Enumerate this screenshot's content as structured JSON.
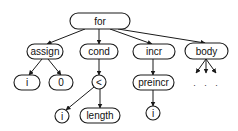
{
  "diagram": {
    "type": "abstract-syntax-tree",
    "root": "for",
    "nodes": [
      {
        "id": "for",
        "label": "for",
        "shape": "rounded-rect",
        "x": 70,
        "y": 13,
        "w": 60,
        "h": 16
      },
      {
        "id": "assign",
        "label": "assign",
        "shape": "rounded-rect",
        "x": 27,
        "y": 44,
        "w": 36,
        "h": 15
      },
      {
        "id": "cond",
        "label": "cond",
        "shape": "rounded-rect",
        "x": 80,
        "y": 44,
        "w": 38,
        "h": 15
      },
      {
        "id": "incr",
        "label": "incr",
        "shape": "rounded-rect",
        "x": 133,
        "y": 44,
        "w": 42,
        "h": 15
      },
      {
        "id": "body",
        "label": "body",
        "shape": "rounded-rect",
        "x": 185,
        "y": 43,
        "w": 43,
        "h": 16
      },
      {
        "id": "assign_i",
        "label": "i",
        "shape": "rounded-rect",
        "x": 14,
        "y": 75,
        "w": 26,
        "h": 15
      },
      {
        "id": "assign_0",
        "label": "0",
        "shape": "rounded-rect",
        "x": 49,
        "y": 75,
        "w": 24,
        "h": 15
      },
      {
        "id": "lt",
        "label": "<",
        "shape": "circle",
        "cx": 99,
        "cy": 82,
        "r": 7
      },
      {
        "id": "preincr",
        "label": "preincr",
        "shape": "rounded-rect",
        "x": 133,
        "y": 75,
        "w": 41,
        "h": 15
      },
      {
        "id": "lt_i",
        "label": "i",
        "shape": "circle",
        "cx": 62,
        "cy": 116,
        "r": 7
      },
      {
        "id": "length",
        "label": "length",
        "shape": "rounded-rect",
        "x": 80,
        "y": 108,
        "w": 40,
        "h": 15
      },
      {
        "id": "preincr_i",
        "label": "i",
        "shape": "circle",
        "cx": 153,
        "cy": 113,
        "r": 7
      }
    ],
    "edges": [
      {
        "from": "for",
        "to": "assign"
      },
      {
        "from": "for",
        "to": "cond"
      },
      {
        "from": "for",
        "to": "incr"
      },
      {
        "from": "for",
        "to": "body"
      },
      {
        "from": "assign",
        "to": "assign_i"
      },
      {
        "from": "assign",
        "to": "assign_0"
      },
      {
        "from": "cond",
        "to": "lt"
      },
      {
        "from": "lt",
        "to": "lt_i"
      },
      {
        "from": "lt",
        "to": "length"
      },
      {
        "from": "incr",
        "to": "preincr"
      },
      {
        "from": "preincr",
        "to": "preincr_i"
      }
    ],
    "body_children_ellipsis": ". . .",
    "colors": {
      "stroke": "#1a1a1a",
      "fill": "#ffffff",
      "text": "#111111",
      "background": "#ffffff"
    }
  }
}
